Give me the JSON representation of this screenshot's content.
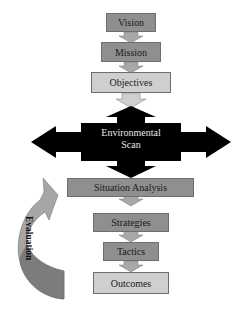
{
  "diagram": {
    "steps": [
      {
        "label": "Vision",
        "shade": "dark"
      },
      {
        "label": "Mission",
        "shade": "dark"
      },
      {
        "label": "Objectives",
        "shade": "light"
      },
      {
        "label": "Situation Analysis",
        "shade": "dark"
      },
      {
        "label": "Strategies",
        "shade": "dark"
      },
      {
        "label": "Tactics",
        "shade": "dark"
      },
      {
        "label": "Outcomes",
        "shade": "light"
      }
    ],
    "environmental_scan": {
      "line1": "Environmental",
      "line2": "Scan"
    },
    "feedback_arrow": {
      "label": "Evaluation"
    },
    "colors": {
      "dark_box": "#8f8f8f",
      "light_box": "#cfcfcf",
      "scan": "#000000",
      "connector": "#b5b5b5"
    }
  }
}
